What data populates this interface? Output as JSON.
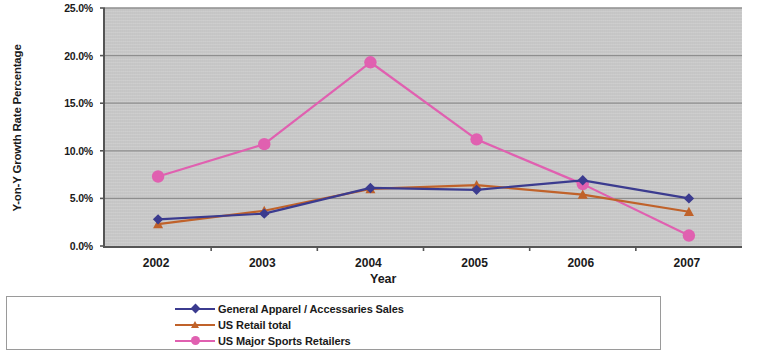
{
  "chart_data": {
    "type": "line",
    "title": "",
    "xlabel": "Year",
    "ylabel": "Y-on-Y Growth Rate Percentage",
    "categories": [
      "2002",
      "2003",
      "2004",
      "2005",
      "2006",
      "2007"
    ],
    "ylim": [
      0,
      25
    ],
    "ytick_labels": [
      "0.0%",
      "5.0%",
      "10.0%",
      "15.0%",
      "20.0%",
      "25.0%"
    ],
    "ytick_values": [
      0,
      5,
      10,
      15,
      20,
      25
    ],
    "grid": "horizontal",
    "legend_position": "bottom",
    "plot_background": "#c9c9c9",
    "series": [
      {
        "name": "General Apparel / Accessaries Sales",
        "color": "#3b3b8f",
        "marker": "diamond",
        "values": [
          2.8,
          3.4,
          6.1,
          5.9,
          6.9,
          5.0
        ]
      },
      {
        "name": "US Retail total",
        "color": "#c0622a",
        "marker": "triangle",
        "values": [
          2.3,
          3.7,
          6.0,
          6.4,
          5.4,
          3.6
        ]
      },
      {
        "name": "US Major Sports Retailers",
        "color": "#e060b0",
        "marker": "circle",
        "values": [
          7.3,
          10.7,
          19.3,
          11.2,
          6.5,
          1.1
        ]
      }
    ]
  }
}
